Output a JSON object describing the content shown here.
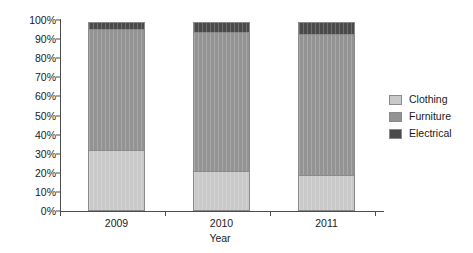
{
  "chart_data": {
    "type": "bar",
    "stacked": true,
    "title": "",
    "subtitle": "",
    "xlabel": "Year",
    "ylabel": "",
    "categories": [
      "2009",
      "2010",
      "2011"
    ],
    "series": [
      {
        "name": "Clothing",
        "values": [
          32,
          21,
          19
        ],
        "color": "#c9c9c9"
      },
      {
        "name": "Furniture",
        "values": [
          64,
          73,
          74
        ],
        "color": "#939393"
      },
      {
        "name": "Electrical",
        "values": [
          4,
          6,
          7
        ],
        "color": "#4a4a4a"
      }
    ],
    "ylim": [
      0,
      100
    ],
    "ytick_labels": [
      "0%",
      "10%",
      "20%",
      "30%",
      "40%",
      "50%",
      "60%",
      "70%",
      "80%",
      "90%",
      "100%"
    ],
    "ytick_values": [
      0,
      10,
      20,
      30,
      40,
      50,
      60,
      70,
      80,
      90,
      100
    ],
    "grid": false,
    "legend_position": "right",
    "legend_entries": [
      "Clothing",
      "Furniture",
      "Electrical"
    ],
    "annotations": [],
    "axis_color": "#4d4d4d",
    "bar_border_color": "#8a8a8a",
    "background": "#ffffff"
  }
}
